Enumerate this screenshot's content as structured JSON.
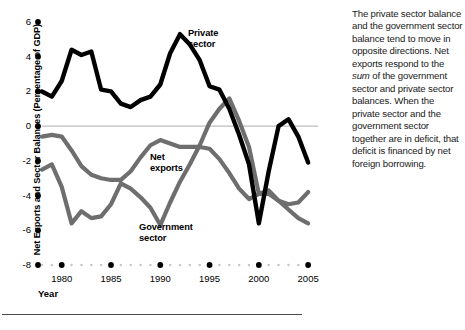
{
  "chart_data": {
    "type": "line",
    "title": "",
    "xlabel": "Year",
    "ylabel": "Net Exports and Sector Balances (Percentage of GDP)",
    "xlim": [
      1978,
      2006
    ],
    "ylim": [
      -8,
      6
    ],
    "ytick_labels": [
      "6",
      "4",
      "2",
      "0",
      "-2",
      "-4",
      "-6",
      "-8"
    ],
    "ytick_values": [
      6,
      4,
      2,
      0,
      -2,
      -4,
      -6,
      -8
    ],
    "xtick_labels": [
      "1980",
      "1985",
      "1990",
      "1995",
      "2000",
      "2005"
    ],
    "xtick_values": [
      1980,
      1985,
      1990,
      1995,
      2000,
      2005
    ],
    "grid": false,
    "legend_position": "inline-annotations",
    "zero_line": true,
    "x": [
      1978,
      1979,
      1980,
      1981,
      1982,
      1983,
      1984,
      1985,
      1986,
      1987,
      1988,
      1989,
      1990,
      1991,
      1992,
      1993,
      1994,
      1995,
      1996,
      1997,
      1998,
      1999,
      2000,
      2001,
      2002,
      2003,
      2004,
      2005
    ],
    "series": [
      {
        "name": "Private sector",
        "color": "#000000",
        "values": [
          2.0,
          1.7,
          2.6,
          4.4,
          4.1,
          4.3,
          2.1,
          2.0,
          1.3,
          1.1,
          1.5,
          1.7,
          2.4,
          4.2,
          5.3,
          4.7,
          3.8,
          2.3,
          2.1,
          1.0,
          -0.5,
          -2.2,
          -5.6,
          -2.6,
          0.0,
          0.4,
          -0.6,
          -2.1
        ]
      },
      {
        "name": "Government sector",
        "color": "#6e6e6e",
        "values": [
          -2.5,
          -2.2,
          -3.5,
          -5.6,
          -4.9,
          -5.3,
          -5.2,
          -4.5,
          -3.3,
          -3.6,
          -4.1,
          -4.7,
          -5.7,
          -4.4,
          -3.2,
          -2.2,
          -1.1,
          0.2,
          1.0,
          1.6,
          0.3,
          -1.2,
          -3.9,
          -3.9,
          -4.3,
          -4.8,
          -5.3,
          -5.6
        ]
      },
      {
        "name": "Net exports",
        "color": "#6e6e6e",
        "values": [
          -0.6,
          -0.5,
          -0.6,
          -1.4,
          -2.3,
          -2.8,
          -3.0,
          -3.1,
          -3.1,
          -2.6,
          -1.8,
          -1.1,
          -0.8,
          -1.0,
          -1.2,
          -1.2,
          -1.2,
          -1.3,
          -1.9,
          -2.7,
          -3.6,
          -4.2,
          -3.9,
          -3.7,
          -4.3,
          -4.5,
          -4.4,
          -3.8
        ]
      }
    ],
    "annotations": [
      {
        "name": "Private sector",
        "text_line1": "Private",
        "text_line2": "sector"
      },
      {
        "name": "Net exports",
        "text_line1": "Net",
        "text_line2": "exports"
      },
      {
        "name": "Government sector",
        "text_line1": "Government",
        "text_line2": "sector"
      }
    ]
  },
  "axis": {
    "y_title": "Net Exports and Sector Balances (Percentage of GDP)",
    "x_title": "Year",
    "y_labels": [
      "6",
      "4",
      "2",
      "0",
      "-2",
      "-4",
      "-6",
      "-8"
    ],
    "x_labels": [
      "1980",
      "1985",
      "1990",
      "1995",
      "2000",
      "2005"
    ]
  },
  "labels": {
    "private_line1": "Private",
    "private_line2": "sector",
    "netexports_line1": "Net",
    "netexports_line2": "exports",
    "government_line1": "Government",
    "government_line2": "sector"
  },
  "commentary": {
    "paragraph_part1": "The private sector balance and the government sector balance tend to move in opposite directions. Net exports respond to the ",
    "emphasis": "sum",
    "paragraph_part2": " of the government sector and private sector balances. When the private sector and the government sector together are in deficit, that deficit is financed by net foreign borrowing."
  },
  "colors": {
    "private_sector": "#000000",
    "government_sector": "#6e6e6e",
    "net_exports": "#6e6e6e",
    "zero_line": "#bdbdbd",
    "axis_dots": "#000000",
    "minor_dots": "#c6c6c6",
    "rule": "#4a4a4a"
  }
}
